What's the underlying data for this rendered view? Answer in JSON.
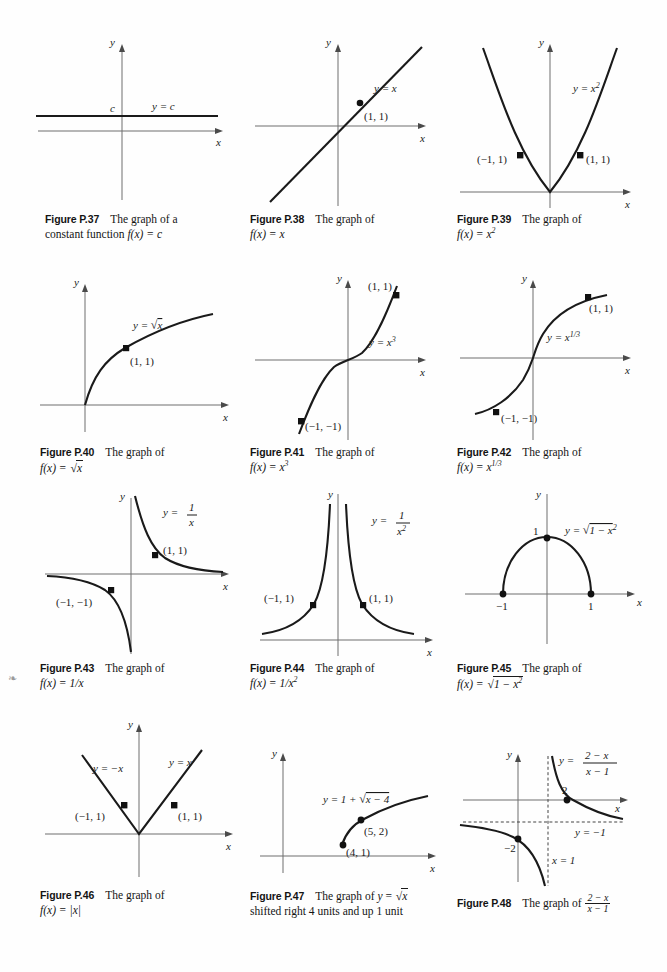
{
  "page": {
    "margin_mark": "❧",
    "axis_label_x": "x",
    "axis_label_y": "y"
  },
  "figures": [
    {
      "id": "p37",
      "number": "Figure P.37",
      "caption_line1": "The graph of a",
      "caption_line2_prefix": "constant function ",
      "caption_math": "f(x) = c",
      "curve_label": "y = c",
      "extra_label": "c",
      "points": [],
      "chart": {
        "type": "line",
        "function": "y = c",
        "description": "Horizontal line above the x-axis representing a constant function"
      }
    },
    {
      "id": "p38",
      "number": "Figure P.38",
      "caption_line1": "The graph of",
      "caption_line2_prefix": "",
      "caption_math": "f(x) = x",
      "curve_label": "y = x",
      "points": [
        {
          "label": "(1, 1)",
          "x": 1,
          "y": 1
        }
      ],
      "chart": {
        "type": "line",
        "function": "y = x",
        "description": "Straight line of slope 1 through the origin"
      }
    },
    {
      "id": "p39",
      "number": "Figure P.39",
      "caption_line1": "The graph of",
      "caption_line2_prefix": "",
      "caption_math": "f(x) = x²",
      "curve_label": "y = x²",
      "points": [
        {
          "label": "(−1, 1)",
          "x": -1,
          "y": 1
        },
        {
          "label": "(1, 1)",
          "x": 1,
          "y": 1
        }
      ],
      "chart": {
        "type": "line",
        "function": "y = x^2",
        "description": "Upward parabola with vertex at the origin"
      }
    },
    {
      "id": "p40",
      "number": "Figure P.40",
      "caption_line1": "The graph of",
      "caption_line2_prefix": "",
      "caption_math": "f(x) = √x",
      "curve_label": "y = √x",
      "points": [
        {
          "label": "(1, 1)",
          "x": 1,
          "y": 1
        }
      ],
      "chart": {
        "type": "line",
        "function": "y = sqrt(x)",
        "description": "Square root curve rising from the origin into the first quadrant"
      }
    },
    {
      "id": "p41",
      "number": "Figure P.41",
      "caption_line1": "The graph of",
      "caption_line2_prefix": "",
      "caption_math": "f(x) = x³",
      "curve_label": "y = x³",
      "points": [
        {
          "label": "(1, 1)",
          "x": 1,
          "y": 1
        },
        {
          "label": "(−1, −1)",
          "x": -1,
          "y": -1
        }
      ],
      "chart": {
        "type": "line",
        "function": "y = x^3",
        "description": "Cubic curve through the origin with an inflection point at zero"
      }
    },
    {
      "id": "p42",
      "number": "Figure P.42",
      "caption_line1": "The graph of",
      "caption_line2_prefix": "",
      "caption_math": "f(x) = x^(1/3)",
      "curve_label": "y = x^(1/3)",
      "points": [
        {
          "label": "(1, 1)",
          "x": 1,
          "y": 1
        },
        {
          "label": "(−1, −1)",
          "x": -1,
          "y": -1
        }
      ],
      "chart": {
        "type": "line",
        "function": "y = x^(1/3)",
        "description": "Cube root curve with vertical tangent at the origin"
      }
    },
    {
      "id": "p43",
      "number": "Figure P.43",
      "caption_line1": "The graph of",
      "caption_line2_prefix": "",
      "caption_math": "f(x) = 1/x",
      "curve_label": "y = 1/x",
      "points": [
        {
          "label": "(1, 1)",
          "x": 1,
          "y": 1
        },
        {
          "label": "(−1, −1)",
          "x": -1,
          "y": -1
        }
      ],
      "chart": {
        "type": "line",
        "function": "y = 1/x",
        "description": "Hyperbola with branches in the first and third quadrants"
      }
    },
    {
      "id": "p44",
      "number": "Figure P.44",
      "caption_line1": "The graph of",
      "caption_line2_prefix": "",
      "caption_math": "f(x) = 1/x²",
      "curve_label": "y = 1/x²",
      "points": [
        {
          "label": "(−1, 1)",
          "x": -1,
          "y": 1
        },
        {
          "label": "(1, 1)",
          "x": 1,
          "y": 1
        }
      ],
      "chart": {
        "type": "line",
        "function": "y = 1/x^2",
        "description": "Two branches above the x-axis approaching the y-axis asymptote"
      }
    },
    {
      "id": "p45",
      "number": "Figure P.45",
      "caption_line1": "The graph of",
      "caption_line2_prefix": "",
      "caption_math": "f(x) = √(1 − x²)",
      "curve_label": "y = √(1 − x²)",
      "points": [
        {
          "label": "−1",
          "x": -1,
          "y": 0
        },
        {
          "label": "1",
          "x": 1,
          "y": 0
        },
        {
          "label": "1",
          "x": 0,
          "y": 1
        }
      ],
      "chart": {
        "type": "line",
        "function": "y = sqrt(1 - x^2)",
        "description": "Upper unit semicircle from (−1,0) to (1,0) with top at (0,1)"
      }
    },
    {
      "id": "p46",
      "number": "Figure P.46",
      "caption_line1": "The graph of",
      "caption_line2_prefix": "",
      "caption_math": "f(x) = |x|",
      "curve_label_left": "y = −x",
      "curve_label_right": "y = x",
      "points": [
        {
          "label": "(−1, 1)",
          "x": -1,
          "y": 1
        },
        {
          "label": "(1, 1)",
          "x": 1,
          "y": 1
        }
      ],
      "chart": {
        "type": "line",
        "function": "y = |x|",
        "description": "V shape with vertex at the origin"
      }
    },
    {
      "id": "p47",
      "number": "Figure P.47",
      "caption_line1": "The graph of y = √x",
      "caption_line2": "shifted right 4 units and up 1 unit",
      "curve_label": "y = 1 + √(x − 4)",
      "points": [
        {
          "label": "(5, 2)",
          "x": 5,
          "y": 2
        },
        {
          "label": "(4, 1)",
          "x": 4,
          "y": 1
        }
      ],
      "chart": {
        "type": "line",
        "function": "y = 1 + sqrt(x - 4)",
        "description": "Square root curve starting at (4,1) passing through (5,2)"
      }
    },
    {
      "id": "p48",
      "number": "Figure P.48",
      "caption_line1": "The graph of",
      "caption_math_num": "2 − x",
      "caption_math_den": "x − 1",
      "curve_label_num": "2 − x",
      "curve_label_den": "x − 1",
      "asymptote_horizontal": "y = −1",
      "asymptote_vertical": "x = 1",
      "points": [
        {
          "label": "2",
          "x": 2,
          "y": 0
        },
        {
          "label": "−2",
          "x": 0,
          "y": -2
        }
      ],
      "chart": {
        "type": "line",
        "function": "y = (2 - x)/(x - 1)",
        "description": "Rational function with vertical asymptote x = 1 and horizontal asymptote y = -1, x-intercept at 2 and y-intercept at -2"
      }
    }
  ],
  "colors": {
    "curve": "#1a1a1a",
    "axis": "#6e6e6e",
    "background": "#fefefe",
    "text": "#141414"
  }
}
